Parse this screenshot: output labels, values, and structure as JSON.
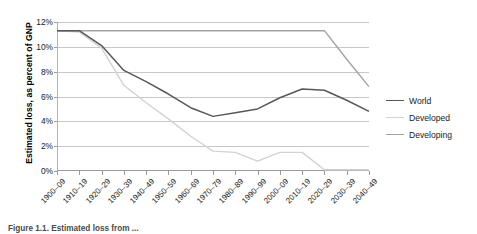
{
  "chart_data": {
    "type": "line",
    "title": "",
    "xlabel": "",
    "ylabel": "Estimated loss, as percent of GNP",
    "ylim": [
      0,
      12
    ],
    "yticks": [
      0,
      2,
      4,
      6,
      8,
      10,
      12
    ],
    "ytick_labels": [
      "0%",
      "2%",
      "4%",
      "6%",
      "8%",
      "10%",
      "12%"
    ],
    "grid": true,
    "legend_position": "right",
    "categories": [
      "1900–09",
      "1910–19",
      "1920–29",
      "1930–39",
      "1940–49",
      "1950–59",
      "1960–69",
      "1970–79",
      "1980–89",
      "1990–99",
      "2000–09",
      "2010–19",
      "2020–29",
      "2030–39",
      "2040–49"
    ],
    "series": [
      {
        "name": "World",
        "color": "#58585a",
        "values": [
          11.3,
          11.3,
          10.1,
          8.1,
          7.2,
          6.2,
          5.1,
          4.4,
          4.7,
          5.0,
          5.9,
          6.6,
          6.5,
          5.7,
          4.8
        ]
      },
      {
        "name": "Developed",
        "color": "#d2d2d2",
        "values": [
          11.3,
          11.2,
          9.9,
          6.9,
          5.5,
          4.2,
          2.8,
          1.6,
          1.5,
          0.8,
          1.5,
          1.5,
          0.1,
          0.1,
          0.1
        ]
      },
      {
        "name": "Developing",
        "color": "#a3a3a3",
        "values": [
          11.3,
          11.3,
          11.3,
          11.3,
          11.3,
          11.3,
          11.3,
          11.3,
          11.3,
          11.3,
          11.3,
          11.3,
          11.3,
          9.0,
          6.8
        ]
      }
    ]
  },
  "legend": {
    "items": [
      {
        "label": "World",
        "color": "#58585a"
      },
      {
        "label": "Developed",
        "color": "#d2d2d2"
      },
      {
        "label": "Developing",
        "color": "#a3a3a3"
      }
    ]
  },
  "caption": {
    "text": "Figure 1.1.  Estimated loss from ..."
  }
}
